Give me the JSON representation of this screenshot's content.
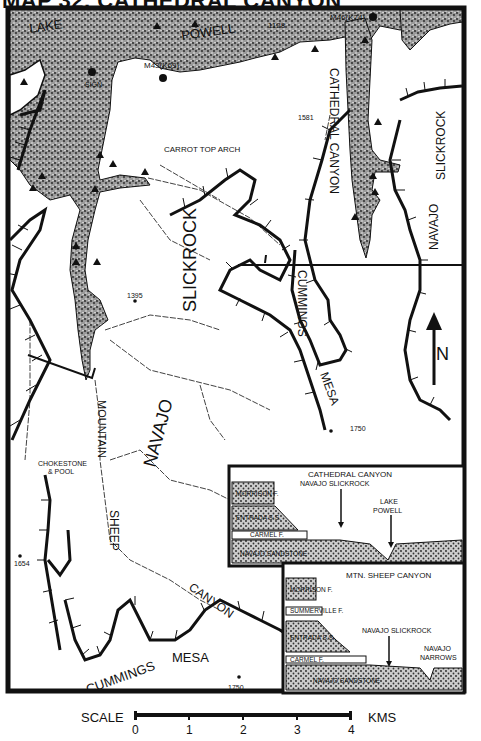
{
  "map": {
    "title": "MAP 32, CATHEDRAL CANYON",
    "labels": {
      "lake": "LAKE",
      "powell": "POWELL",
      "cathedral_canyon": "CATHEDRAL CANYON",
      "slickrock_east": "SLICKROCK",
      "navajo_east": "NAVAJO",
      "carrot_top_arch": "CARROT TOP ARCH",
      "slickrock_center": "SLICKROCK",
      "cummings_north": "CUMMINGS",
      "mesa_north": "MESA",
      "navajo_center": "NAVAJO",
      "mountain": "MOUNTAIN",
      "sheep": "SHEEP",
      "canyon": "CANYON",
      "mesa_south": "MESA",
      "cummings_south": "CUMMINGS",
      "chokestone_1": "CHOKESTONE",
      "chokestone_2": "& POOL",
      "sign": "SIGN",
      "m43": "M43(K69)",
      "m46": "M46(K74)",
      "north": "N"
    },
    "elevations": {
      "e1128": "1128",
      "e1581": "1581",
      "e1395": "1395",
      "e1750_north": "1750",
      "e1654": "1654",
      "e1750_south": "1750"
    },
    "legend": {
      "water_pattern": "stipple",
      "campsite_symbol": "triangle",
      "marker_symbol": "filled-circle"
    }
  },
  "insets": {
    "cathedral": {
      "title": "CATHEDRAL CANYON",
      "layers": [
        "MORRISON F.",
        "ENTRADA S.S.",
        "CARMEL F.",
        "NAVAJO SANDSTONE"
      ],
      "arrows": [
        "NAVAJO SLICKROCK",
        "LAKE",
        "POWELL"
      ]
    },
    "mtn_sheep": {
      "title": "MTN. SHEEP CANYON",
      "layers": [
        "MORRISON F.",
        "SUMMERVILLE F.",
        "ENTRADA S.S.",
        "CARMEL F.",
        "NAVAJO SANDSTONE"
      ],
      "arrows": [
        "NAVAJO SLICKROCK",
        "NAVAJO",
        "NARROWS"
      ]
    }
  },
  "scale": {
    "label": "SCALE",
    "unit": "KMS",
    "ticks": [
      "0",
      "1",
      "2",
      "3",
      "4"
    ]
  },
  "colors": {
    "ink": "#111111",
    "paper": "#ffffff",
    "water": "#8a8a8a"
  }
}
